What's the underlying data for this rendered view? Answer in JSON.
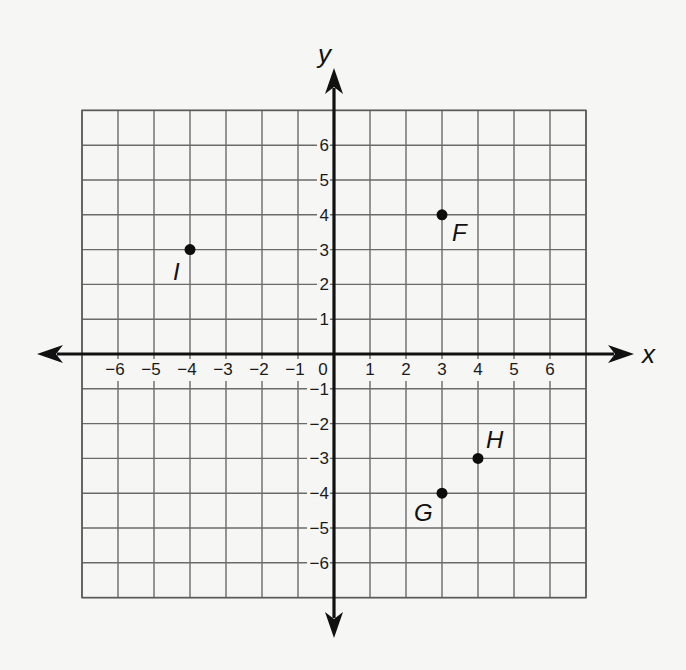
{
  "chart_data": {
    "type": "scatter",
    "title": "",
    "xlabel": "x",
    "ylabel": "y",
    "xlim": [
      -7,
      7
    ],
    "ylim": [
      -7,
      7
    ],
    "grid": true,
    "x_ticks": [
      -6,
      -5,
      -4,
      -3,
      -2,
      -1,
      0,
      1,
      2,
      3,
      4,
      5,
      6
    ],
    "y_ticks": [
      6,
      5,
      4,
      3,
      2,
      1,
      -1,
      -2,
      -3,
      -4,
      -5,
      -6
    ],
    "origin_label": "0",
    "points": [
      {
        "label": "F",
        "x": 3,
        "y": 4
      },
      {
        "label": "G",
        "x": 3,
        "y": -4
      },
      {
        "label": "H",
        "x": 4,
        "y": -3
      },
      {
        "label": "I",
        "x": -4,
        "y": 3
      }
    ]
  },
  "layout": {
    "origin_px": [
      334,
      354
    ],
    "cell_w": 36,
    "cell_h": 34.8,
    "grid_cells": 7,
    "arrow_left": 37,
    "arrow_right": 634,
    "arrow_top": 68,
    "arrow_bottom": 638,
    "label_offsets": {
      "F": [
        10,
        26
      ],
      "G": [
        -28,
        28
      ],
      "H": [
        8,
        -10
      ],
      "I": [
        -17,
        30
      ]
    }
  },
  "colors": {
    "background": "#f6f6f5",
    "grid": "#6a6a6a",
    "axis": "#111111",
    "point": "#0d0d0d"
  }
}
